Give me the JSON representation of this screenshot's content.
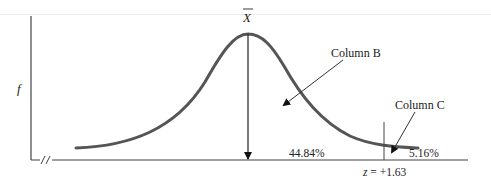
{
  "diagram": {
    "type": "normal-distribution-area",
    "y_axis_label": "f",
    "mean_label": "X̄",
    "mean_label_base": "X",
    "callouts": [
      {
        "label": "Column B",
        "points_to": "area between mean and z"
      },
      {
        "label": "Column C",
        "points_to": "tail area beyond z"
      }
    ],
    "areas": {
      "between_mean_and_z": "44.84%",
      "tail_beyond_z": "5.16%"
    },
    "z_label": "z = +1.63",
    "axis_break_mark": "//",
    "colors": {
      "curve": "#555555",
      "axis": "#444444",
      "text": "#222222",
      "background": "#ffffff"
    }
  }
}
